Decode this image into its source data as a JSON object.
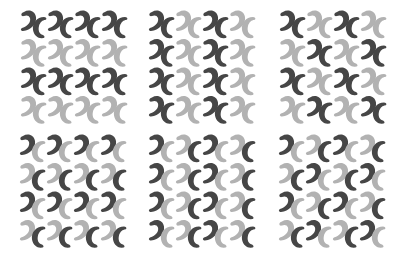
{
  "colors": {
    "dark": "#464646",
    "light": "#b2b2b2",
    "background": "#ffffff"
  },
  "grid": {
    "rows": 4,
    "cols": 4,
    "unit_pitch_x": 27,
    "unit_pitch_y": 28.5
  },
  "panels": [
    {
      "id": "panel-1",
      "left": 20,
      "top": 9,
      "pattern": "rows alternate dark/light",
      "hooks": [
        [
          "D",
          "D",
          "D",
          "D"
        ],
        [
          "L",
          "L",
          "L",
          "L"
        ],
        [
          "D",
          "D",
          "D",
          "D"
        ],
        [
          "L",
          "L",
          "L",
          "L"
        ]
      ],
      "crescents": [
        [
          "D",
          "D",
          "D",
          "D"
        ],
        [
          "L",
          "L",
          "L",
          "L"
        ],
        [
          "D",
          "D",
          "D",
          "D"
        ],
        [
          "L",
          "L",
          "L",
          "L"
        ]
      ]
    },
    {
      "id": "panel-2",
      "left": 148,
      "top": 9,
      "pattern": "columns alternate dark/light",
      "hooks": [
        [
          "D",
          "L",
          "D",
          "L"
        ],
        [
          "D",
          "L",
          "D",
          "L"
        ],
        [
          "D",
          "L",
          "D",
          "L"
        ],
        [
          "D",
          "L",
          "D",
          "L"
        ]
      ],
      "crescents": [
        [
          "D",
          "L",
          "D",
          "L"
        ],
        [
          "D",
          "L",
          "D",
          "L"
        ],
        [
          "D",
          "L",
          "D",
          "L"
        ],
        [
          "D",
          "L",
          "D",
          "L"
        ]
      ]
    },
    {
      "id": "panel-3",
      "left": 279,
      "top": 9,
      "pattern": "checkerboard",
      "hooks": [
        [
          "D",
          "L",
          "D",
          "L"
        ],
        [
          "L",
          "D",
          "L",
          "D"
        ],
        [
          "D",
          "L",
          "D",
          "L"
        ],
        [
          "L",
          "D",
          "L",
          "D"
        ]
      ],
      "crescents": [
        [
          "D",
          "L",
          "D",
          "L"
        ],
        [
          "L",
          "D",
          "L",
          "D"
        ],
        [
          "D",
          "L",
          "D",
          "L"
        ],
        [
          "L",
          "D",
          "L",
          "D"
        ]
      ]
    },
    {
      "id": "panel-4",
      "left": 19,
      "top": 133,
      "pattern": "hooks and crescents alternate by row",
      "hooks": [
        [
          "D",
          "D",
          "D",
          "D"
        ],
        [
          "L",
          "L",
          "L",
          "L"
        ],
        [
          "D",
          "D",
          "D",
          "D"
        ],
        [
          "L",
          "L",
          "L",
          "L"
        ]
      ],
      "crescents": [
        [
          "L",
          "L",
          "L",
          "L"
        ],
        [
          "D",
          "D",
          "D",
          "D"
        ],
        [
          "L",
          "L",
          "L",
          "L"
        ],
        [
          "D",
          "D",
          "D",
          "D"
        ]
      ]
    },
    {
      "id": "panel-5",
      "left": 148,
      "top": 133,
      "pattern": "hook/crescent alternate within row, same every row",
      "hooks": [
        [
          "D",
          "L",
          "D",
          "L"
        ],
        [
          "D",
          "L",
          "D",
          "L"
        ],
        [
          "D",
          "L",
          "D",
          "L"
        ],
        [
          "D",
          "L",
          "D",
          "L"
        ]
      ],
      "crescents": [
        [
          "L",
          "D",
          "L",
          "D"
        ],
        [
          "L",
          "D",
          "L",
          "D"
        ],
        [
          "L",
          "D",
          "L",
          "D"
        ],
        [
          "L",
          "D",
          "L",
          "D"
        ]
      ]
    },
    {
      "id": "panel-6",
      "left": 278,
      "top": 133,
      "pattern": "hook/crescent alternate within row, rows shift",
      "hooks": [
        [
          "D",
          "L",
          "D",
          "L"
        ],
        [
          "L",
          "D",
          "L",
          "D"
        ],
        [
          "D",
          "L",
          "D",
          "L"
        ],
        [
          "L",
          "D",
          "L",
          "D"
        ]
      ],
      "crescents": [
        [
          "L",
          "D",
          "L",
          "D"
        ],
        [
          "D",
          "L",
          "D",
          "L"
        ],
        [
          "L",
          "D",
          "L",
          "D"
        ],
        [
          "D",
          "L",
          "D",
          "L"
        ]
      ]
    }
  ]
}
